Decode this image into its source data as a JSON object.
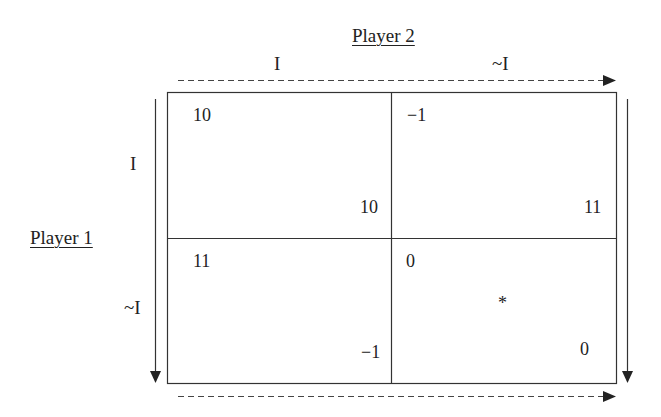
{
  "players": {
    "column_player": "Player 2",
    "row_player": "Player 1"
  },
  "column_strategies": [
    "I",
    "~I"
  ],
  "row_strategies": [
    "I",
    "~I"
  ],
  "cells": {
    "r0c0": {
      "row_payoff": "10",
      "col_payoff": "10"
    },
    "r0c1": {
      "row_payoff": "−1",
      "col_payoff": "11"
    },
    "r1c0": {
      "row_payoff": "11",
      "col_payoff": "−1"
    },
    "r1c1": {
      "row_payoff": "0",
      "col_payoff": "0",
      "marker": "*"
    }
  },
  "colors": {
    "line": "#222222",
    "dashed": "#444444"
  }
}
